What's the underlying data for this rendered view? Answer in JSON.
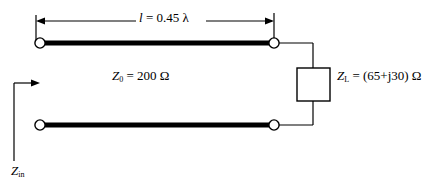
{
  "diagram": {
    "colors": {
      "line": "#000000",
      "background": "#ffffff",
      "conductor": "#000000"
    },
    "labels": {
      "length": {
        "symbol": "l",
        "equals": "=",
        "value": "0.45",
        "unit": "λ",
        "full": "l = 0.45 λ"
      },
      "characteristic_impedance": {
        "symbol": "Z",
        "subscript": "0",
        "equals": "=",
        "value": "200",
        "unit": "Ω",
        "full": "Z0 = 200 Ω"
      },
      "load_impedance": {
        "symbol": "Z",
        "subscript": "L",
        "equals": "=",
        "value": "(65+j30)",
        "unit": "Ω",
        "full": "ZL = (65+j30) Ω"
      },
      "input_impedance": {
        "symbol": "Z",
        "subscript": "in",
        "full": "Zin"
      }
    },
    "components": {
      "load_box": "load-impedance-box",
      "top_conductor": "top-conductor",
      "bottom_conductor": "bottom-conductor",
      "terminals": [
        "top-left-terminal",
        "top-right-terminal",
        "bottom-left-terminal",
        "bottom-right-terminal"
      ],
      "dimension_line": "length-dimension-line",
      "input_arrow": "input-impedance-arrow"
    }
  }
}
